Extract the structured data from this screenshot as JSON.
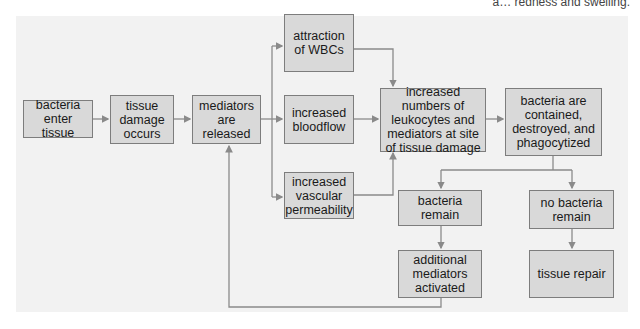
{
  "caption": "a… redness and swelling.",
  "colors": {
    "panel": "#f2f2f2",
    "box_fill": "#d9d9d9",
    "box_border": "#7d7d7d",
    "arrow": "#8a8a8a"
  },
  "nodes": {
    "bacteria_enter": "bacteria enter tissue",
    "tissue_damage": "tissue damage occurs",
    "mediators_released": "mediators are released",
    "attraction_wbcs": "attraction of WBCs",
    "increased_bloodflow": "increased bloodflow",
    "increased_permeability": "increased vascular permeability",
    "increased_numbers": "increased numbers of leukocytes and mediators at site of tissue damage",
    "bacteria_contained": "bacteria are contained, destroyed, and phagocytized",
    "bacteria_remain": "bacteria remain",
    "no_bacteria_remain": "no bacteria remain",
    "additional_mediators": "additional mediators activated",
    "tissue_repair": "tissue repair"
  },
  "edges": [
    [
      "bacteria_enter",
      "tissue_damage"
    ],
    [
      "tissue_damage",
      "mediators_released"
    ],
    [
      "mediators_released",
      "attraction_wbcs"
    ],
    [
      "mediators_released",
      "increased_bloodflow"
    ],
    [
      "mediators_released",
      "increased_permeability"
    ],
    [
      "attraction_wbcs",
      "increased_numbers"
    ],
    [
      "increased_bloodflow",
      "increased_numbers"
    ],
    [
      "increased_permeability",
      "increased_numbers"
    ],
    [
      "increased_numbers",
      "bacteria_contained"
    ],
    [
      "bacteria_contained",
      "bacteria_remain"
    ],
    [
      "bacteria_contained",
      "no_bacteria_remain"
    ],
    [
      "bacteria_remain",
      "additional_mediators"
    ],
    [
      "no_bacteria_remain",
      "tissue_repair"
    ],
    [
      "additional_mediators",
      "mediators_released"
    ]
  ]
}
